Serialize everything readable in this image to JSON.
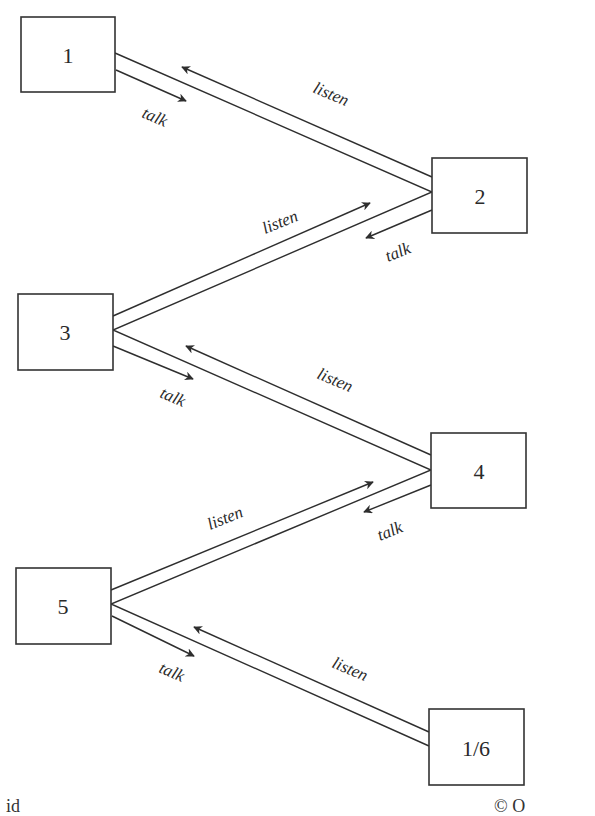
{
  "diagram": {
    "title": "",
    "nodes": [
      {
        "id": "n1",
        "label": "1",
        "x": 21,
        "y": 17,
        "w": 94,
        "h": 75
      },
      {
        "id": "n2",
        "label": "2",
        "x": 432,
        "y": 158,
        "w": 95,
        "h": 75
      },
      {
        "id": "n3",
        "label": "3",
        "x": 18,
        "y": 294,
        "w": 95,
        "h": 76
      },
      {
        "id": "n4",
        "label": "4",
        "x": 431,
        "y": 433,
        "w": 95,
        "h": 75
      },
      {
        "id": "n5",
        "label": "5",
        "x": 16,
        "y": 568,
        "w": 95,
        "h": 76
      },
      {
        "id": "n6",
        "label": "1/6",
        "x": 429,
        "y": 709,
        "w": 95,
        "h": 76
      }
    ],
    "edges": [
      {
        "from": "1",
        "to": "2",
        "talk_label": "talk",
        "listen_label": "listen"
      },
      {
        "from": "2",
        "to": "3",
        "talk_label": "talk",
        "listen_label": "listen"
      },
      {
        "from": "3",
        "to": "4",
        "talk_label": "talk",
        "listen_label": "listen"
      },
      {
        "from": "4",
        "to": "5",
        "talk_label": "talk",
        "listen_label": "listen"
      },
      {
        "from": "5",
        "to": "1/6",
        "talk_label": "talk",
        "listen_label": "listen"
      }
    ],
    "labels": {
      "talk": "talk",
      "listen": "listen"
    }
  },
  "footer": {
    "left_text": "id",
    "right_text": "© O"
  }
}
